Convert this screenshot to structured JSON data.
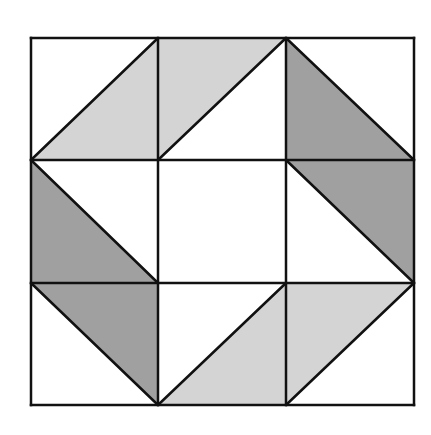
{
  "diagram": {
    "type": "quilt-block",
    "grid": {
      "rows": 3,
      "cols": 3,
      "x": [
        31,
        158,
        286,
        414
      ],
      "y": [
        38,
        160,
        283,
        405
      ]
    },
    "colors": {
      "background": "#ffffff",
      "light": "#d4d4d4",
      "dark": "#a0a0a0",
      "stroke": "#111111",
      "stroke_width": 2.5
    },
    "cells": [
      {
        "row": 0,
        "col": 0,
        "diagonal": "ascending",
        "shaded": "lower-right",
        "shade": "light"
      },
      {
        "row": 0,
        "col": 1,
        "diagonal": "ascending",
        "shaded": "upper-left",
        "shade": "light"
      },
      {
        "row": 0,
        "col": 2,
        "diagonal": "descending",
        "shaded": "lower-left",
        "shade": "dark"
      },
      {
        "row": 1,
        "col": 0,
        "diagonal": "descending",
        "shaded": "lower-left",
        "shade": "dark"
      },
      {
        "row": 1,
        "col": 1,
        "diagonal": "none",
        "shaded": "none",
        "shade": "none"
      },
      {
        "row": 1,
        "col": 2,
        "diagonal": "descending",
        "shaded": "upper-right",
        "shade": "dark"
      },
      {
        "row": 2,
        "col": 0,
        "diagonal": "descending",
        "shaded": "upper-right",
        "shade": "dark"
      },
      {
        "row": 2,
        "col": 1,
        "diagonal": "ascending",
        "shaded": "lower-right",
        "shade": "light"
      },
      {
        "row": 2,
        "col": 2,
        "diagonal": "ascending",
        "shaded": "upper-left",
        "shade": "light"
      }
    ]
  }
}
